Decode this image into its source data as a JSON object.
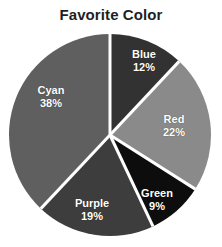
{
  "chart_data": {
    "type": "pie",
    "title": "Favorite Color",
    "categories": [
      "Blue",
      "Red",
      "Green",
      "Purple",
      "Cyan"
    ],
    "values": [
      12,
      22,
      9,
      19,
      38
    ],
    "value_labels": [
      "12%",
      "22%",
      "9%",
      "19%",
      "38%"
    ],
    "units": "percent",
    "total": 100,
    "start_angle_deg": 0,
    "direction": "clockwise",
    "legend": "none",
    "grid": false,
    "slice_colors": [
      "#323232",
      "#8a8a8a",
      "#0d0d0d",
      "#3d3d3d",
      "#5f5f5f"
    ],
    "separator_color": "#ffffff",
    "background_color": "#ffffff",
    "label_color": "#ffffff",
    "title_color": "#1f1f1f",
    "slices": [
      {
        "name": "Blue",
        "value": 12,
        "value_label": "12%",
        "color": "#323232",
        "start_deg": 0,
        "end_deg": 43.2,
        "label_x": 144,
        "label_y": 60
      },
      {
        "name": "Red",
        "value": 22,
        "value_label": "22%",
        "color": "#8a8a8a",
        "start_deg": 43.2,
        "end_deg": 122.4,
        "label_x": 174,
        "label_y": 125
      },
      {
        "name": "Green",
        "value": 9,
        "value_label": "9%",
        "color": "#0d0d0d",
        "start_deg": 122.4,
        "end_deg": 154.8,
        "label_x": 157,
        "label_y": 199
      },
      {
        "name": "Purple",
        "value": 19,
        "value_label": "19%",
        "color": "#3d3d3d",
        "start_deg": 154.8,
        "end_deg": 223.2,
        "label_x": 92,
        "label_y": 209
      },
      {
        "name": "Cyan",
        "value": 38,
        "value_label": "38%",
        "color": "#5f5f5f",
        "start_deg": 223.2,
        "end_deg": 360,
        "label_x": 51,
        "label_y": 96
      }
    ],
    "geometry": {
      "center_x": 110,
      "center_y": 135,
      "radius": 101,
      "separator_width": 3
    }
  }
}
